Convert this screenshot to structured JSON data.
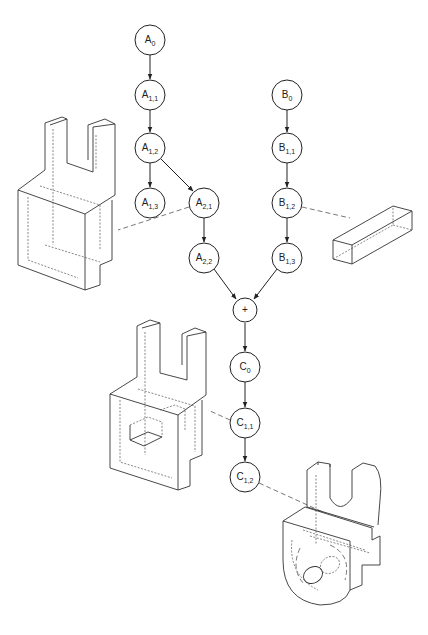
{
  "diagram": {
    "type": "feature-operation graph with part models",
    "nodes": [
      {
        "id": "A0",
        "base": "A",
        "sub": "0",
        "x": 150,
        "y": 40
      },
      {
        "id": "A11",
        "base": "A",
        "sub": "1,1",
        "x": 150,
        "y": 95
      },
      {
        "id": "A12",
        "base": "A",
        "sub": "1,2",
        "x": 150,
        "y": 148
      },
      {
        "id": "A13",
        "base": "A",
        "sub": "1,3",
        "x": 150,
        "y": 203
      },
      {
        "id": "A21",
        "base": "A",
        "sub": "2,1",
        "x": 204,
        "y": 203
      },
      {
        "id": "A22",
        "base": "A",
        "sub": "2,2",
        "x": 204,
        "y": 258
      },
      {
        "id": "B0",
        "base": "B",
        "sub": "0",
        "x": 287,
        "y": 95
      },
      {
        "id": "B11",
        "base": "B",
        "sub": "1,1",
        "x": 287,
        "y": 148
      },
      {
        "id": "B12",
        "base": "B",
        "sub": "1,2",
        "x": 287,
        "y": 203
      },
      {
        "id": "B13",
        "base": "B",
        "sub": "1,3",
        "x": 287,
        "y": 258
      },
      {
        "id": "PLUS",
        "base": "+",
        "sub": "",
        "x": 245,
        "y": 310
      },
      {
        "id": "C0",
        "base": "C",
        "sub": "0",
        "x": 245,
        "y": 367
      },
      {
        "id": "C11",
        "base": "C",
        "sub": "1,1",
        "x": 245,
        "y": 423
      },
      {
        "id": "C12",
        "base": "C",
        "sub": "1,2",
        "x": 245,
        "y": 477
      }
    ],
    "edges": [
      [
        "A0",
        "A11"
      ],
      [
        "A11",
        "A12"
      ],
      [
        "A12",
        "A13"
      ],
      [
        "A12",
        "A21"
      ],
      [
        "A21",
        "A22"
      ],
      [
        "B0",
        "B11"
      ],
      [
        "B11",
        "B12"
      ],
      [
        "B12",
        "B13"
      ],
      [
        "A22",
        "PLUS"
      ],
      [
        "B13",
        "PLUS"
      ],
      [
        "PLUS",
        "C0"
      ],
      [
        "C0",
        "C11"
      ],
      [
        "C11",
        "C12"
      ]
    ],
    "models": [
      {
        "name": "part-model-A21",
        "linked_node": "A21",
        "description": "U-shaped bracket with rectangular loop"
      },
      {
        "name": "part-model-B12",
        "linked_node": "B12",
        "description": "rectangular bar"
      },
      {
        "name": "part-model-C11",
        "linked_node": "C11",
        "description": "combined bracket with bar"
      },
      {
        "name": "part-model-C12",
        "linked_node": "C12",
        "description": "rounded bracket with hole"
      }
    ],
    "labels": {
      "A0": "A",
      "A0_sub": "0",
      "A11": "A",
      "A11_sub": "1,1",
      "A12": "A",
      "A12_sub": "1,2",
      "A13": "A",
      "A13_sub": "1,3",
      "A21": "A",
      "A21_sub": "2,1",
      "A22": "A",
      "A22_sub": "2,2",
      "B0": "B",
      "B0_sub": "0",
      "B11": "B",
      "B11_sub": "1,1",
      "B12": "B",
      "B12_sub": "1,2",
      "B13": "B",
      "B13_sub": "1,3",
      "PLUS": "+",
      "C0": "C",
      "C0_sub": "0",
      "C11": "C",
      "C11_sub": "1,1",
      "C12": "C",
      "C12_sub": "1,2"
    }
  }
}
